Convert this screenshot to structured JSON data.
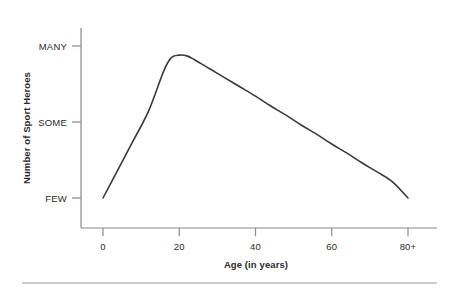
{
  "chart_data": {
    "type": "line",
    "title": "",
    "subtitle": "",
    "xlabel": "Age (in years)",
    "ylabel": "Number of Sport Heroes",
    "xtick_labels": [
      "0",
      "20",
      "40",
      "60",
      "80+"
    ],
    "xtick_values": [
      0,
      20,
      40,
      60,
      80
    ],
    "ytick_labels": [
      "FEW",
      "SOME",
      "MANY"
    ],
    "ytick_values": [
      1,
      2,
      3
    ],
    "xlim": [
      0,
      80
    ],
    "ylim": [
      0.65,
      3.25
    ],
    "grid": false,
    "legend": null,
    "series": [
      {
        "name": "Number of Sport Heroes by Age",
        "x": [
          0,
          4,
          8,
          12,
          16,
          18,
          20,
          22,
          24,
          28,
          32,
          36,
          40,
          44,
          48,
          52,
          56,
          60,
          64,
          68,
          72,
          76,
          80
        ],
        "y": [
          1.0,
          1.38,
          1.76,
          2.15,
          2.68,
          2.85,
          2.88,
          2.87,
          2.82,
          2.7,
          2.58,
          2.46,
          2.34,
          2.21,
          2.09,
          1.96,
          1.84,
          1.71,
          1.59,
          1.46,
          1.34,
          1.21,
          1.0
        ],
        "y_labels_note": "FEW=1, SOME=2, MANY=3",
        "color": "#3a3a3a",
        "line_width": 1.6
      }
    ],
    "annotations": [],
    "axis_color": "#8a8a8a",
    "text_color": "#2b2b2b"
  },
  "figure": {
    "footer_rule": true
  }
}
